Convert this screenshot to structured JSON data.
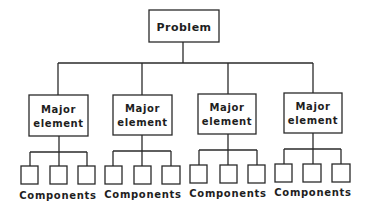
{
  "diagram": {
    "type": "hierarchy-tree",
    "root": {
      "label": "Problem"
    },
    "major_elements": [
      {
        "line1": "Major",
        "line2": "element",
        "components_label": "Components",
        "component_count": 3
      },
      {
        "line1": "Major",
        "line2": "element",
        "components_label": "Components",
        "component_count": 3
      },
      {
        "line1": "Major",
        "line2": "element",
        "components_label": "Components",
        "component_count": 3
      },
      {
        "line1": "Major",
        "line2": "element",
        "components_label": "Components",
        "component_count": 3
      }
    ],
    "colors": {
      "line": "#2a2a2a",
      "text": "#1e1e1e",
      "background": "#ffffff"
    }
  }
}
